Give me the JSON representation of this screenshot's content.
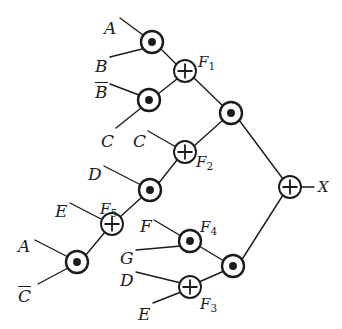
{
  "diagram": {
    "output_label": "X",
    "ink_color": "#1b1b1b",
    "background_color": "#ffffff",
    "gate_symbols": {
      "and": "dot",
      "xor": "plus"
    },
    "inputs": [
      {
        "id": "in-a-top",
        "text": "A",
        "overline": false,
        "x": 104,
        "y": 20
      },
      {
        "id": "in-b",
        "text": "B",
        "overline": false,
        "x": 95,
        "y": 58
      },
      {
        "id": "in-b-bar",
        "text": "B",
        "overline": true,
        "x": 95,
        "y": 82
      },
      {
        "id": "in-c-left",
        "text": "C",
        "overline": false,
        "x": 101,
        "y": 133
      },
      {
        "id": "in-c-mid",
        "text": "C",
        "overline": false,
        "x": 133,
        "y": 133
      },
      {
        "id": "in-d-upper",
        "text": "D",
        "overline": false,
        "x": 88,
        "y": 166
      },
      {
        "id": "in-e-upper",
        "text": "E",
        "overline": false,
        "x": 55,
        "y": 203
      },
      {
        "id": "in-a-lower",
        "text": "A",
        "overline": false,
        "x": 18,
        "y": 238
      },
      {
        "id": "in-c-bar",
        "text": "C",
        "overline": true,
        "x": 18,
        "y": 286
      },
      {
        "id": "in-f",
        "text": "F",
        "overline": false,
        "x": 140,
        "y": 218
      },
      {
        "id": "in-g",
        "text": "G",
        "overline": false,
        "x": 120,
        "y": 250
      },
      {
        "id": "in-d-lower",
        "text": "D",
        "overline": false,
        "x": 120,
        "y": 272
      },
      {
        "id": "in-e-lower",
        "text": "E",
        "overline": false,
        "x": 138,
        "y": 306
      }
    ],
    "gate_labels": [
      {
        "id": "label-f1",
        "base": "F",
        "sub": "1",
        "x": 198,
        "y": 55
      },
      {
        "id": "label-f2",
        "base": "F",
        "sub": "2",
        "x": 196,
        "y": 155
      },
      {
        "id": "label-f5",
        "base": "F",
        "sub": "5",
        "x": 100,
        "y": 202
      },
      {
        "id": "label-f4",
        "base": "F",
        "sub": "4",
        "x": 200,
        "y": 220
      },
      {
        "id": "label-f3",
        "base": "F",
        "sub": "3",
        "x": 200,
        "y": 297
      },
      {
        "id": "label-x",
        "base": "X",
        "sub": "",
        "x": 318,
        "y": 180
      }
    ],
    "gates": [
      {
        "id": "and-ab",
        "type": "and",
        "cx": 152,
        "cy": 42,
        "r": 11
      },
      {
        "id": "and-bbar-c",
        "type": "and",
        "cx": 149,
        "cy": 100,
        "r": 11
      },
      {
        "id": "xor-f1",
        "type": "xor",
        "cx": 185,
        "cy": 71,
        "r": 11
      },
      {
        "id": "and-upper-mid",
        "type": "and",
        "cx": 231,
        "cy": 113,
        "r": 11
      },
      {
        "id": "xor-f2",
        "type": "xor",
        "cx": 185,
        "cy": 152,
        "r": 11
      },
      {
        "id": "and-d-f5",
        "type": "and",
        "cx": 150,
        "cy": 190,
        "r": 11
      },
      {
        "id": "xor-f5",
        "type": "xor",
        "cx": 112,
        "cy": 224,
        "r": 11
      },
      {
        "id": "and-a-cbar",
        "type": "and",
        "cx": 77,
        "cy": 262,
        "r": 11
      },
      {
        "id": "and-f4-fg",
        "type": "and",
        "cx": 190,
        "cy": 241,
        "r": 11
      },
      {
        "id": "xor-f3",
        "type": "xor",
        "cx": 190,
        "cy": 287,
        "r": 11
      },
      {
        "id": "and-lower-mid",
        "type": "and",
        "cx": 233,
        "cy": 266,
        "r": 11
      },
      {
        "id": "xor-out-x",
        "type": "xor",
        "cx": 290,
        "cy": 187,
        "r": 11
      }
    ],
    "wires": [
      {
        "id": "w-a-to-and-ab",
        "x1": 120,
        "y1": 18,
        "x2": 143,
        "y2": 35
      },
      {
        "id": "w-b-to-and-ab",
        "x1": 110,
        "y1": 57,
        "x2": 142,
        "y2": 49
      },
      {
        "id": "w-bbar-to-and-bc",
        "x1": 110,
        "y1": 84,
        "x2": 139,
        "y2": 95
      },
      {
        "id": "w-c-to-and-bc",
        "x1": 116,
        "y1": 128,
        "x2": 141,
        "y2": 108
      },
      {
        "id": "w-and-ab-to-f1",
        "x1": 161,
        "y1": 49,
        "x2": 176,
        "y2": 64
      },
      {
        "id": "w-and-bc-to-f1",
        "x1": 158,
        "y1": 94,
        "x2": 177,
        "y2": 79
      },
      {
        "id": "w-f1-to-andmid",
        "x1": 194,
        "y1": 78,
        "x2": 223,
        "y2": 106
      },
      {
        "id": "w-c2-to-f2",
        "x1": 148,
        "y1": 131,
        "x2": 176,
        "y2": 147
      },
      {
        "id": "w-f2-to-andmid",
        "x1": 194,
        "y1": 146,
        "x2": 223,
        "y2": 120
      },
      {
        "id": "w-andmid-to-x",
        "x1": 239,
        "y1": 120,
        "x2": 283,
        "y2": 179
      },
      {
        "id": "w-d-to-and-d-f5",
        "x1": 104,
        "y1": 166,
        "x2": 141,
        "y2": 185
      },
      {
        "id": "w-and-d-f5-to-f2",
        "x1": 158,
        "y1": 184,
        "x2": 177,
        "y2": 160
      },
      {
        "id": "w-f5-to-and-d-f5",
        "x1": 120,
        "y1": 217,
        "x2": 142,
        "y2": 197
      },
      {
        "id": "w-e-to-f5",
        "x1": 70,
        "y1": 203,
        "x2": 103,
        "y2": 220
      },
      {
        "id": "w-and-acbar-to-f5",
        "x1": 85,
        "y1": 256,
        "x2": 105,
        "y2": 232
      },
      {
        "id": "w-a2-to-and-acbar",
        "x1": 35,
        "y1": 240,
        "x2": 68,
        "y2": 257
      },
      {
        "id": "w-cbar-to-and-acbar",
        "x1": 38,
        "y1": 284,
        "x2": 68,
        "y2": 268
      },
      {
        "id": "w-f-to-and-fg",
        "x1": 154,
        "y1": 220,
        "x2": 181,
        "y2": 236
      },
      {
        "id": "w-g-to-and-fg",
        "x1": 136,
        "y1": 250,
        "x2": 181,
        "y2": 246
      },
      {
        "id": "w-and-fg-to-lowmid",
        "x1": 199,
        "y1": 246,
        "x2": 224,
        "y2": 261
      },
      {
        "id": "w-d2-to-f3",
        "x1": 136,
        "y1": 272,
        "x2": 181,
        "y2": 283
      },
      {
        "id": "w-e2-to-f3",
        "x1": 153,
        "y1": 303,
        "x2": 181,
        "y2": 292
      },
      {
        "id": "w-f3-to-lowmid",
        "x1": 199,
        "y1": 282,
        "x2": 224,
        "y2": 271
      },
      {
        "id": "w-lowmid-to-x",
        "x1": 241,
        "y1": 261,
        "x2": 283,
        "y2": 195
      },
      {
        "id": "w-x-out",
        "x1": 301,
        "y1": 187,
        "x2": 314,
        "y2": 187
      }
    ]
  }
}
